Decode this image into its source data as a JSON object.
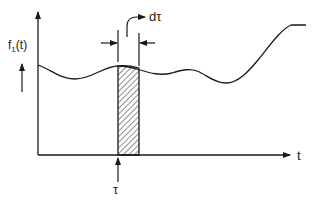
{
  "diagram": {
    "title": "",
    "colors": {
      "ink": "#1a1a1a",
      "background": "#ffffff",
      "hatch": "#333333"
    },
    "y_axis": {
      "label_main": "f",
      "label_sub": "1",
      "label_suffix": "(t)"
    },
    "x_axis": {
      "label": "t"
    },
    "strip": {
      "width_label": "dτ",
      "position_label": "τ"
    }
  }
}
